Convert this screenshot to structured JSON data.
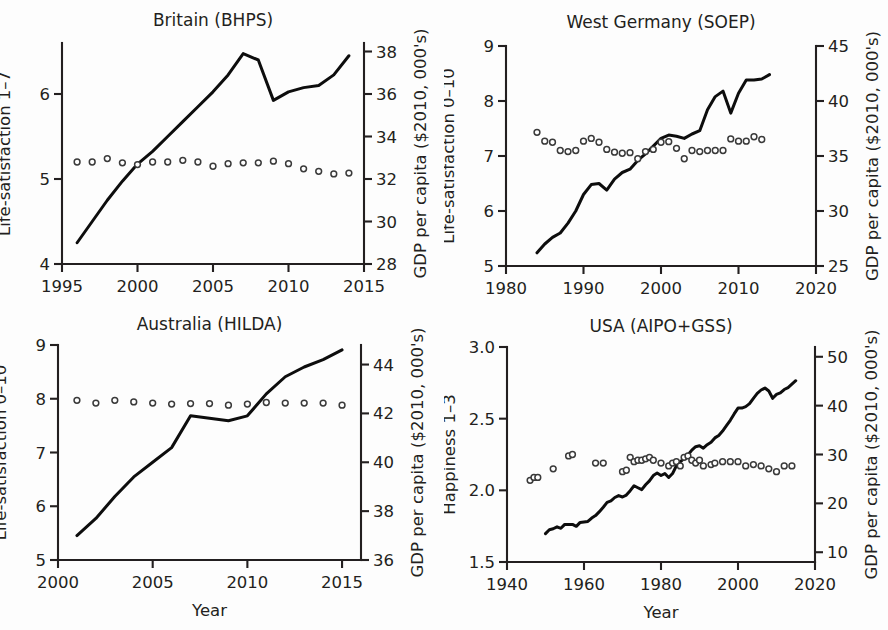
{
  "figure": {
    "background": "#ffffff",
    "ink_color": "#231f20",
    "line_color": "#0d0d0d",
    "marker_color": "#3a3a3a",
    "shared_xlabel": "Year",
    "gdp_axis_label": "GDP per capita ($2010, 000's)"
  },
  "chart_data": [
    {
      "id": "britain",
      "type": "line",
      "title": "Britain (BHPS)",
      "xlabel": "",
      "ylabel": "Life-satisfaction 1–7",
      "y2label": "GDP per capita ($2010, 000's)",
      "xlim": [
        1995,
        2015
      ],
      "xticks": [
        1995,
        2000,
        2005,
        2010,
        2015
      ],
      "xticklabels": [
        "1995",
        "2000",
        "2005",
        "2010",
        "2015"
      ],
      "ylim": [
        4,
        6.6
      ],
      "yticks": [
        4,
        5,
        6
      ],
      "yticklabels": [
        "4",
        "5",
        "6"
      ],
      "y2lim": [
        28,
        38.4
      ],
      "y2ticks": [
        28,
        30,
        32,
        34,
        36,
        38
      ],
      "y2ticklabels": [
        "28",
        "30",
        "32",
        "34",
        "36",
        "38"
      ],
      "grid": false,
      "legend": "none",
      "series": [
        {
          "name": "GDP per capita",
          "axis": "right",
          "style": "line",
          "x": [
            1996,
            1997,
            1998,
            1999,
            2000,
            2001,
            2002,
            2003,
            2004,
            2005,
            2006,
            2007,
            2008,
            2009,
            2010,
            2011,
            2012,
            2013,
            2014
          ],
          "values": [
            29.0,
            30.0,
            31.0,
            31.9,
            32.7,
            33.3,
            34.0,
            34.7,
            35.4,
            36.1,
            36.9,
            37.9,
            37.6,
            35.7,
            36.1,
            36.3,
            36.4,
            36.9,
            37.8
          ]
        },
        {
          "name": "Life-satisfaction",
          "axis": "left",
          "style": "dots",
          "x": [
            1996,
            1997,
            1998,
            1999,
            2000,
            2001,
            2002,
            2003,
            2004,
            2005,
            2006,
            2007,
            2008,
            2009,
            2010,
            2011,
            2012,
            2013,
            2014
          ],
          "values": [
            5.2,
            5.2,
            5.24,
            5.19,
            5.17,
            5.2,
            5.2,
            5.22,
            5.2,
            5.15,
            5.18,
            5.19,
            5.19,
            5.21,
            5.18,
            5.12,
            5.09,
            5.06,
            5.07
          ]
        }
      ]
    },
    {
      "id": "west-germany",
      "type": "line",
      "title": "West Germany (SOEP)",
      "xlabel": "",
      "ylabel": "Life-satisfaction 0–10",
      "y2label": "GDP per capita ($2010, 000's)",
      "xlim": [
        1980,
        2020
      ],
      "xticks": [
        1980,
        1990,
        2000,
        2010,
        2020
      ],
      "xticklabels": [
        "1980",
        "1990",
        "2000",
        "2010",
        "2020"
      ],
      "ylim": [
        5,
        9
      ],
      "yticks": [
        5,
        6,
        7,
        8,
        9
      ],
      "yticklabels": [
        "5",
        "6",
        "7",
        "8",
        "9"
      ],
      "y2lim": [
        25,
        45
      ],
      "y2ticks": [
        25,
        30,
        35,
        40,
        45
      ],
      "y2ticklabels": [
        "25",
        "30",
        "35",
        "40",
        "45"
      ],
      "grid": false,
      "legend": "none",
      "series": [
        {
          "name": "GDP per capita",
          "axis": "right",
          "style": "line",
          "x": [
            1984,
            1985,
            1986,
            1987,
            1988,
            1989,
            1990,
            1991,
            1992,
            1993,
            1994,
            1995,
            1996,
            1997,
            1998,
            1999,
            2000,
            2001,
            2002,
            2003,
            2004,
            2005,
            2006,
            2007,
            2008,
            2009,
            2010,
            2011,
            2012,
            2013,
            2014
          ],
          "values": [
            26.2,
            27.0,
            27.6,
            28.0,
            28.9,
            30.0,
            31.5,
            32.4,
            32.5,
            31.9,
            32.9,
            33.5,
            33.8,
            34.6,
            35.2,
            35.9,
            36.6,
            36.9,
            36.8,
            36.6,
            37.0,
            37.3,
            39.2,
            40.4,
            40.9,
            38.9,
            40.7,
            41.9,
            41.9,
            42.0,
            42.4
          ]
        },
        {
          "name": "Life-satisfaction",
          "axis": "left",
          "style": "dots",
          "x": [
            1984,
            1985,
            1986,
            1987,
            1988,
            1989,
            1990,
            1991,
            1992,
            1993,
            1994,
            1995,
            1996,
            1997,
            1998,
            1999,
            2000,
            2001,
            2002,
            2003,
            2004,
            2005,
            2006,
            2007,
            2008,
            2009,
            2010,
            2011,
            2012,
            2013
          ],
          "values": [
            7.43,
            7.27,
            7.25,
            7.1,
            7.08,
            7.1,
            7.27,
            7.32,
            7.25,
            7.12,
            7.07,
            7.05,
            7.06,
            6.95,
            7.08,
            7.12,
            7.25,
            7.26,
            7.14,
            6.95,
            7.1,
            7.08,
            7.1,
            7.1,
            7.1,
            7.31,
            7.27,
            7.27,
            7.35,
            7.3
          ]
        }
      ]
    },
    {
      "id": "australia",
      "type": "line",
      "title": "Australia (HILDA)",
      "xlabel": "Year",
      "ylabel": "Life-satisfaction 0–10",
      "y2label": "GDP per capita ($2010, 000's)",
      "xlim": [
        2000,
        2016
      ],
      "xticks": [
        2000,
        2005,
        2010,
        2015
      ],
      "xticklabels": [
        "2000",
        "2005",
        "2010",
        "2015"
      ],
      "ylim": [
        5,
        9
      ],
      "yticks": [
        5,
        6,
        7,
        8,
        9
      ],
      "yticklabels": [
        "5",
        "6",
        "7",
        "8",
        "9"
      ],
      "y2lim": [
        36,
        44.8
      ],
      "y2ticks": [
        36,
        38,
        40,
        42,
        44
      ],
      "y2ticklabels": [
        "36",
        "38",
        "40",
        "42",
        "44"
      ],
      "grid": false,
      "legend": "none",
      "series": [
        {
          "name": "GDP per capita",
          "axis": "right",
          "style": "line",
          "x": [
            2001,
            2002,
            2003,
            2004,
            2005,
            2006,
            2007,
            2008,
            2009,
            2010,
            2011,
            2012,
            2013,
            2014,
            2015
          ],
          "values": [
            37.0,
            37.7,
            38.6,
            39.4,
            40.0,
            40.6,
            41.9,
            41.8,
            41.7,
            41.9,
            42.8,
            43.5,
            43.9,
            44.2,
            44.6
          ]
        },
        {
          "name": "Life-satisfaction",
          "axis": "left",
          "style": "dots",
          "x": [
            2001,
            2002,
            2003,
            2004,
            2005,
            2006,
            2007,
            2008,
            2009,
            2010,
            2011,
            2012,
            2013,
            2014,
            2015
          ],
          "values": [
            7.97,
            7.92,
            7.97,
            7.94,
            7.92,
            7.9,
            7.91,
            7.91,
            7.88,
            7.9,
            7.93,
            7.92,
            7.92,
            7.92,
            7.88
          ]
        }
      ]
    },
    {
      "id": "usa",
      "type": "line",
      "title": "USA (AIPO+GSS)",
      "xlabel": "Year",
      "ylabel": "Happiness 1–3",
      "y2label": "GDP per capita ($2010, 000's)",
      "xlim": [
        1940,
        2020
      ],
      "xticks": [
        1940,
        1960,
        1980,
        2000,
        2020
      ],
      "xticklabels": [
        "1940",
        "1960",
        "1980",
        "2000",
        "2020"
      ],
      "ylim": [
        1.5,
        3.0
      ],
      "yticks": [
        1.5,
        2.0,
        2.5,
        3.0
      ],
      "yticklabels": [
        "1.5",
        "2.0",
        "2.5",
        "3.0"
      ],
      "y2lim": [
        8,
        52
      ],
      "y2ticks": [
        10,
        20,
        30,
        40,
        50
      ],
      "y2ticklabels": [
        "10",
        "20",
        "30",
        "40",
        "50"
      ],
      "grid": false,
      "legend": "none",
      "series": [
        {
          "name": "GDP per capita",
          "axis": "right",
          "style": "line",
          "x": [
            1950,
            1951,
            1952,
            1953,
            1954,
            1955,
            1956,
            1957,
            1958,
            1959,
            1960,
            1961,
            1962,
            1963,
            1964,
            1965,
            1966,
            1967,
            1968,
            1969,
            1970,
            1971,
            1972,
            1973,
            1974,
            1975,
            1976,
            1977,
            1978,
            1979,
            1980,
            1981,
            1982,
            1983,
            1984,
            1985,
            1986,
            1987,
            1988,
            1989,
            1990,
            1991,
            1992,
            1993,
            1994,
            1995,
            1996,
            1997,
            1998,
            1999,
            2000,
            2001,
            2002,
            2003,
            2004,
            2005,
            2006,
            2007,
            2008,
            2009,
            2010,
            2011,
            2012,
            2013,
            2014,
            2015
          ],
          "values": [
            13.8,
            14.6,
            14.8,
            15.2,
            14.9,
            15.7,
            15.7,
            15.7,
            15.3,
            16.1,
            16.2,
            16.3,
            17.0,
            17.5,
            18.3,
            19.2,
            20.2,
            20.5,
            21.2,
            21.6,
            21.3,
            21.7,
            22.6,
            23.6,
            23.2,
            22.8,
            23.8,
            24.6,
            25.7,
            26.2,
            25.7,
            26.1,
            25.3,
            26.1,
            27.7,
            28.5,
            29.2,
            29.9,
            30.9,
            31.6,
            31.8,
            31.3,
            32.0,
            32.5,
            33.4,
            33.9,
            34.8,
            35.9,
            37.0,
            38.3,
            39.5,
            39.5,
            39.8,
            40.4,
            41.5,
            42.5,
            43.2,
            43.6,
            43.0,
            41.5,
            42.3,
            42.6,
            43.3,
            43.7,
            44.4,
            45.1
          ]
        },
        {
          "name": "Happiness",
          "axis": "left",
          "style": "dots",
          "x": [
            1946,
            1947,
            1948,
            1952,
            1956,
            1957,
            1963,
            1965,
            1970,
            1971,
            1972,
            1973,
            1974,
            1975,
            1976,
            1977,
            1978,
            1980,
            1982,
            1983,
            1984,
            1985,
            1986,
            1987,
            1988,
            1989,
            1990,
            1991,
            1993,
            1994,
            1996,
            1998,
            2000,
            2002,
            2004,
            2006,
            2008,
            2010,
            2012,
            2014
          ],
          "values": [
            2.07,
            2.09,
            2.09,
            2.15,
            2.24,
            2.25,
            2.19,
            2.19,
            2.13,
            2.14,
            2.23,
            2.2,
            2.21,
            2.21,
            2.22,
            2.23,
            2.21,
            2.19,
            2.17,
            2.19,
            2.2,
            2.17,
            2.23,
            2.24,
            2.21,
            2.19,
            2.21,
            2.17,
            2.18,
            2.19,
            2.2,
            2.2,
            2.2,
            2.17,
            2.18,
            2.17,
            2.15,
            2.13,
            2.17,
            2.17
          ]
        }
      ]
    }
  ]
}
